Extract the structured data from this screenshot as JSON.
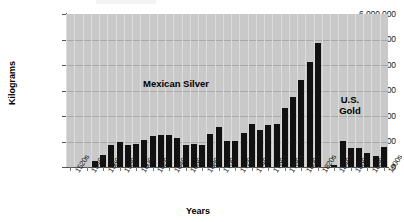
{
  "chart_data": {
    "type": "bar",
    "title": "",
    "xlabel": "Years",
    "ylabel": "Kilograms",
    "ylim": [
      0,
      6000000
    ],
    "ytick_labels": [
      "6,000,000",
      "5,000,000",
      "4,000,000",
      "3,000,000",
      "2,000,000",
      "1,000,000",
      "0"
    ],
    "ytick_values": [
      6000000,
      5000000,
      4000000,
      3000000,
      2000000,
      1000000,
      0
    ],
    "grid": "horizontal-and-vertical",
    "legend_position": "in-plot-annotations",
    "categories": [
      "1520s",
      "1530s",
      "1540s",
      "1550s",
      "1560s",
      "1570s",
      "1580s",
      "1590s",
      "1600s",
      "1610s",
      "1620s",
      "1630s",
      "1640s",
      "1650s",
      "1660s",
      "1670s",
      "1680s",
      "1690s",
      "1700s",
      "1710s",
      "1720s",
      "1730s",
      "1740s",
      "1750s",
      "1760s",
      "1770s",
      "1780s",
      "1790s",
      "1800s",
      "1810s",
      "1820s",
      "1830s",
      "1840s",
      "1850s",
      "1860s",
      "1870s",
      "1880s",
      "1890s",
      "1900s"
    ],
    "tick_labels_shown": [
      "1520s",
      "1540s",
      "1560s",
      "1580s",
      "1600s",
      "1620s",
      "1640s",
      "1660s",
      "1680s",
      "1700s",
      "1720s",
      "1740s",
      "1760s",
      "1780s",
      "1800s",
      "1820s",
      "1840s",
      "1860s",
      "1880s",
      "1900s"
    ],
    "series": [
      {
        "name": "Mexican Silver",
        "color": "#111111",
        "values": [
          0,
          0,
          0,
          250000,
          480000,
          850000,
          1000000,
          880000,
          900000,
          1060000,
          1230000,
          1250000,
          1250000,
          1130000,
          880000,
          900000,
          870000,
          1300000,
          1560000,
          1030000,
          1020000,
          1320000,
          1700000,
          1460000,
          1640000,
          1680000,
          2300000,
          2750000,
          3400000,
          4100000,
          4850000,
          0,
          0,
          0,
          0,
          0,
          0,
          0,
          0
        ]
      },
      {
        "name": "U.S. Gold",
        "color": "#111111",
        "values": [
          0,
          0,
          0,
          0,
          0,
          0,
          0,
          0,
          0,
          0,
          0,
          0,
          0,
          0,
          0,
          0,
          0,
          0,
          0,
          0,
          0,
          0,
          0,
          0,
          0,
          0,
          0,
          0,
          0,
          0,
          0,
          0,
          90000,
          1020000,
          760000,
          730000,
          560000,
          450000,
          800000
        ]
      }
    ],
    "annotations": [
      {
        "id": "mexican-silver",
        "text": "Mexican Silver"
      },
      {
        "id": "us-gold",
        "text": "U.S.\nGold",
        "line1": "U.S.",
        "line2": "Gold"
      }
    ]
  },
  "labels": {
    "y_axis_title": "Kilograms",
    "x_axis_title": "Years",
    "annotation_mexican_silver": "Mexican Silver",
    "annotation_us_gold_line1": "U.S.",
    "annotation_us_gold_line2": "Gold"
  }
}
